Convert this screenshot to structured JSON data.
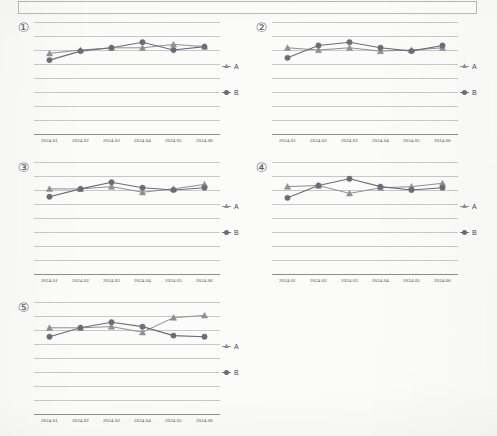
{
  "banner": {
    "text": ""
  },
  "legend": {
    "series_a_label": "A",
    "series_b_label": "B",
    "marker_a": "triangle-marker",
    "marker_b": "circle-marker"
  },
  "colors": {
    "series_a": "#8f8f96",
    "series_b": "#6b6b7a",
    "grid": "#c8c8c6",
    "axis": "#8e8e8c",
    "text": "#4a4a4a",
    "page_background": "#fbfbfa",
    "banner_border": "#b9b9b6"
  },
  "chart_data": [
    {
      "type": "line",
      "id": "chart-1",
      "number": "①",
      "title": "",
      "xlabel": "",
      "ylabel": "",
      "grid": true,
      "gridlines": 8,
      "legend_position": "right",
      "categories": [
        "2024.01",
        "2024.02",
        "2024.03",
        "2024.04",
        "2024.05",
        "2024.06"
      ],
      "ylim": [
        0,
        100
      ],
      "series": [
        {
          "name": "A",
          "values": [
            72,
            75,
            77,
            77,
            80,
            78
          ]
        },
        {
          "name": "B",
          "values": [
            66,
            74,
            77,
            82,
            75,
            78
          ]
        }
      ]
    },
    {
      "type": "line",
      "id": "chart-2",
      "number": "②",
      "title": "",
      "xlabel": "",
      "ylabel": "",
      "grid": true,
      "gridlines": 8,
      "legend_position": "right",
      "categories": [
        "2024.01",
        "2024.02",
        "2024.03",
        "2024.04",
        "2024.05",
        "2024.06"
      ],
      "ylim": [
        0,
        100
      ],
      "series": [
        {
          "name": "A",
          "values": [
            77,
            75,
            77,
            74,
            75,
            77
          ]
        },
        {
          "name": "B",
          "values": [
            68,
            79,
            82,
            77,
            74,
            79
          ]
        }
      ]
    },
    {
      "type": "line",
      "id": "chart-3",
      "number": "③",
      "title": "",
      "xlabel": "",
      "ylabel": "",
      "grid": true,
      "gridlines": 8,
      "legend_position": "right",
      "categories": [
        "2024.01",
        "2024.02",
        "2024.03",
        "2024.04",
        "2024.05",
        "2024.06"
      ],
      "ylim": [
        0,
        100
      ],
      "series": [
        {
          "name": "A",
          "values": [
            76,
            76,
            78,
            73,
            76,
            80
          ]
        },
        {
          "name": "B",
          "values": [
            69,
            76,
            82,
            77,
            75,
            77
          ]
        }
      ]
    },
    {
      "type": "line",
      "id": "chart-4",
      "number": "④",
      "title": "",
      "xlabel": "",
      "ylabel": "",
      "grid": true,
      "gridlines": 8,
      "legend_position": "right",
      "categories": [
        "2024.01",
        "2024.02",
        "2024.03",
        "2024.04",
        "2024.05",
        "2024.06"
      ],
      "ylim": [
        0,
        100
      ],
      "series": [
        {
          "name": "A",
          "values": [
            78,
            79,
            72,
            77,
            78,
            81
          ]
        },
        {
          "name": "B",
          "values": [
            68,
            79,
            85,
            78,
            75,
            77
          ]
        }
      ]
    },
    {
      "type": "line",
      "id": "chart-5",
      "number": "⑤",
      "title": "",
      "xlabel": "",
      "ylabel": "",
      "grid": true,
      "gridlines": 8,
      "legend_position": "right",
      "categories": [
        "2024.01",
        "2024.02",
        "2024.03",
        "2024.04",
        "2024.05",
        "2024.06"
      ],
      "ylim": [
        0,
        100
      ],
      "series": [
        {
          "name": "A",
          "values": [
            77,
            77,
            78,
            73,
            86,
            88
          ]
        },
        {
          "name": "B",
          "values": [
            69,
            77,
            82,
            78,
            70,
            69
          ]
        }
      ]
    }
  ]
}
